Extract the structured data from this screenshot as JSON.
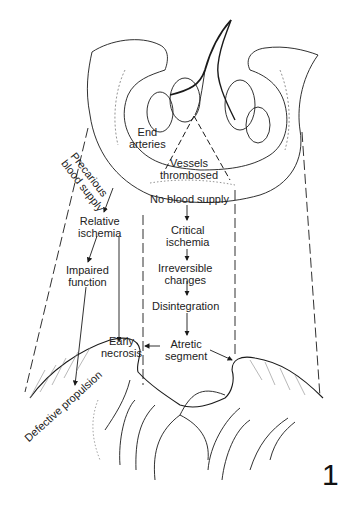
{
  "figure": {
    "number": "1",
    "labels": {
      "end_arteries": [
        "End",
        "arteries"
      ],
      "precarious_blood_supply": [
        "Precarious",
        "blood supply"
      ],
      "vessels_thrombosed": [
        "Vessels",
        "thrombosed"
      ],
      "no_blood_supply": "No blood supply",
      "relative_ischemia": [
        "Relative",
        "ischemia"
      ],
      "impaired_function": [
        "Impaired",
        "function"
      ],
      "critical_ischemia": [
        "Critical",
        "ischemia"
      ],
      "irreversible_changes": [
        "Irreversible",
        "changes"
      ],
      "disintegration": "Disintegration",
      "early_necrosis": [
        "Early",
        "necrosis"
      ],
      "atretic_segment": [
        "Atretic",
        "segment"
      ],
      "defective_propulsion": "Defective propulsion"
    },
    "colors": {
      "ink": "#1a1a1a",
      "hatch": "#888888",
      "background": "#ffffff"
    }
  }
}
